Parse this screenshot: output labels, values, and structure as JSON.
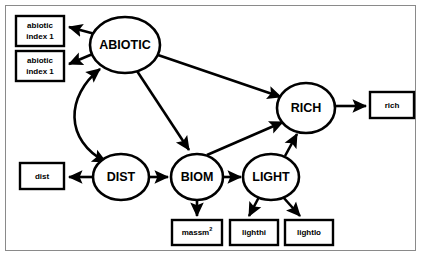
{
  "diagram": {
    "type": "sem-path-diagram",
    "title": "",
    "frame_color": "#8a8a8a",
    "stroke_color": "#000000",
    "background_color": "#ffffff",
    "latent_nodes": [
      {
        "id": "abiotic",
        "label": "ABIOTIC",
        "shape": "ellipse",
        "cx": 125,
        "cy": 45,
        "rx": 35,
        "ry": 28
      },
      {
        "id": "rich",
        "label": "RICH",
        "shape": "ellipse",
        "cx": 306,
        "cy": 108,
        "rx": 29,
        "ry": 25
      },
      {
        "id": "dist",
        "label": "DIST",
        "shape": "ellipse",
        "cx": 121,
        "cy": 177,
        "rx": 28,
        "ry": 23
      },
      {
        "id": "biom",
        "label": "BIOM",
        "shape": "ellipse",
        "cx": 197,
        "cy": 177,
        "rx": 26,
        "ry": 23
      },
      {
        "id": "light",
        "label": "LIGHT",
        "shape": "ellipse",
        "cx": 271,
        "cy": 177,
        "rx": 28,
        "ry": 23
      }
    ],
    "observed_nodes": [
      {
        "id": "abiotic-index-1-a",
        "label": "abiotic index 1",
        "line1": "abiotic",
        "line2": "index 1",
        "x": 16,
        "y": 16,
        "w": 48,
        "h": 30
      },
      {
        "id": "abiotic-index-1-b",
        "label": "abiotic index 1",
        "line1": "abiotic",
        "line2": "index 1",
        "x": 16,
        "y": 51,
        "w": 48,
        "h": 30
      },
      {
        "id": "rich-indicator",
        "label": "rich",
        "x": 370,
        "y": 92,
        "w": 44,
        "h": 26
      },
      {
        "id": "dist-indicator",
        "label": "dist",
        "x": 20,
        "y": 163,
        "w": 44,
        "h": 26
      },
      {
        "id": "massm2-indicator",
        "label": "massm2",
        "base": "massm",
        "sup": "2",
        "x": 172,
        "y": 220,
        "w": 50,
        "h": 25
      },
      {
        "id": "lighthi-indicator",
        "label": "lighthi",
        "x": 230,
        "y": 220,
        "w": 48,
        "h": 25
      },
      {
        "id": "lightlo-indicator",
        "label": "lightlo",
        "x": 285,
        "y": 220,
        "w": 48,
        "h": 25
      }
    ],
    "edges": [
      {
        "id": "abiotic-to-index-a",
        "from": "abiotic",
        "to": "abiotic-index-1-a",
        "style": "straight",
        "arrow": "end"
      },
      {
        "id": "abiotic-to-index-b",
        "from": "abiotic",
        "to": "abiotic-index-1-b",
        "style": "straight",
        "arrow": "end"
      },
      {
        "id": "abiotic-to-rich",
        "from": "abiotic",
        "to": "rich",
        "style": "straight",
        "arrow": "end"
      },
      {
        "id": "abiotic-to-biom",
        "from": "abiotic",
        "to": "biom",
        "style": "straight",
        "arrow": "end"
      },
      {
        "id": "abiotic-dist-curve",
        "from": "abiotic",
        "to": "dist",
        "style": "curved",
        "arrow": "both"
      },
      {
        "id": "dist-to-indicator",
        "from": "dist",
        "to": "dist-indicator",
        "style": "straight",
        "arrow": "end"
      },
      {
        "id": "dist-to-biom",
        "from": "dist",
        "to": "biom",
        "style": "straight",
        "arrow": "end"
      },
      {
        "id": "biom-to-massm2",
        "from": "biom",
        "to": "massm2-indicator",
        "style": "straight",
        "arrow": "end"
      },
      {
        "id": "biom-to-light",
        "from": "biom",
        "to": "light",
        "style": "straight",
        "arrow": "end"
      },
      {
        "id": "biom-to-rich",
        "from": "biom",
        "to": "rich",
        "style": "straight",
        "arrow": "end"
      },
      {
        "id": "light-to-rich",
        "from": "light",
        "to": "rich",
        "style": "straight",
        "arrow": "end"
      },
      {
        "id": "light-to-lighthi",
        "from": "light",
        "to": "lighthi-indicator",
        "style": "straight",
        "arrow": "end"
      },
      {
        "id": "light-to-lightlo",
        "from": "light",
        "to": "lightlo-indicator",
        "style": "straight",
        "arrow": "end"
      },
      {
        "id": "rich-to-indicator",
        "from": "rich",
        "to": "rich-indicator",
        "style": "straight",
        "arrow": "end"
      }
    ]
  }
}
